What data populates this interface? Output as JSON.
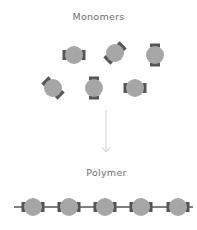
{
  "diagram": {
    "title_top": "Monomers",
    "title_bottom": "Polymer",
    "colors": {
      "circle": "#a6a6a6",
      "cap": "#555555",
      "chain_line": "#555555",
      "arrow": "#cfcfcf",
      "text": "#6e6e6e"
    },
    "monomers": [
      {
        "cx": 74,
        "cy": 55,
        "rotation": 0
      },
      {
        "cx": 115,
        "cy": 53,
        "rotation": -45
      },
      {
        "cx": 155,
        "cy": 55,
        "rotation": 90
      },
      {
        "cx": 53,
        "cy": 88,
        "rotation": 45
      },
      {
        "cx": 94,
        "cy": 88,
        "rotation": 90
      },
      {
        "cx": 135,
        "cy": 88,
        "rotation": 0
      }
    ],
    "polymer": {
      "y": 207,
      "x_start": 14,
      "x_end": 193,
      "units_cx": [
        33,
        69,
        105,
        141,
        178
      ]
    },
    "arrow": {
      "x": 106,
      "y1": 110,
      "y2": 152
    }
  }
}
